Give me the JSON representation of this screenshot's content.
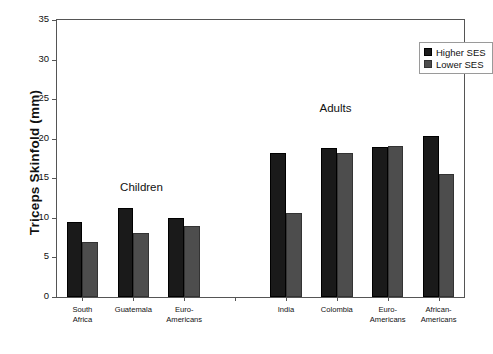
{
  "chart_data": {
    "type": "bar",
    "title": "",
    "xlabel": "",
    "ylabel": "Triceps Skinfold (mm)",
    "ylim": [
      0,
      35
    ],
    "yticks": [
      0,
      5,
      10,
      15,
      20,
      25,
      30,
      35
    ],
    "ytick_labels": [
      "0",
      "5",
      "10",
      "15",
      "20",
      "25",
      "30",
      "35"
    ],
    "grid": false,
    "legend_position": "top-right",
    "categories": [
      "South\nAfrica",
      "Guatemala",
      "Euro-\nAmericans",
      "India",
      "Colombia",
      "Euro-\nAmericans",
      "African-\nAmericans"
    ],
    "series": [
      {
        "name": "Higher SES",
        "color": "#1a1a1a",
        "values": [
          9.5,
          11.2,
          10.0,
          18.2,
          18.8,
          18.9,
          20.4
        ]
      },
      {
        "name": "Lower SES",
        "color": "#4d4d4d",
        "values": [
          7.0,
          8.1,
          9.0,
          10.6,
          18.2,
          19.1,
          15.6
        ]
      }
    ],
    "annotations": [
      {
        "text": "Children",
        "x_frac": 0.155,
        "y_value": 13.2
      },
      {
        "text": "Adults",
        "x_frac": 0.645,
        "y_value": 23.1
      }
    ],
    "group_gap_after_index": 2
  },
  "legend": {
    "entries": [
      {
        "label": "Higher SES"
      },
      {
        "label": "Lower SES"
      }
    ]
  },
  "axis": {
    "y_title": "Triceps Skinfold (mm)"
  }
}
